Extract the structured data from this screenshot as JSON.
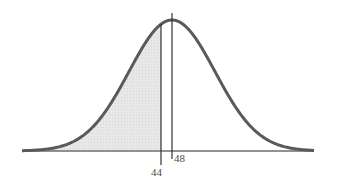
{
  "chart_data": {
    "type": "area",
    "title": "",
    "subtitle": "",
    "xlabel": "",
    "ylabel": "",
    "distribution": "normal",
    "mean": 48,
    "shaded_region": {
      "from": "-inf",
      "to": 44,
      "side": "left"
    },
    "markers": [
      {
        "value": 48,
        "label": "48",
        "position": "above-axis"
      },
      {
        "value": 44,
        "label": "44",
        "position": "below-axis"
      }
    ],
    "grid": false,
    "legend": null
  },
  "labels": {
    "mean": "48",
    "cutoff": "44"
  },
  "colors": {
    "curve": "#5a5a5a",
    "shade": "#e6e6e6",
    "axis": "#6e6e6e",
    "lines": "#333333"
  }
}
